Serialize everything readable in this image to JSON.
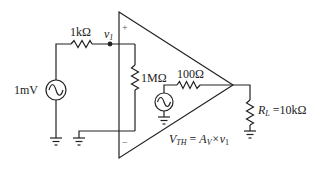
{
  "diagram": {
    "type": "circuit",
    "source": {
      "label": "1mV",
      "type": "ac-voltage-source"
    },
    "input_resistor": {
      "label": "1kΩ"
    },
    "node": {
      "label": "v",
      "subscript": "1"
    },
    "input_impedance": {
      "label": "1MΩ"
    },
    "output_resistor": {
      "label": "100Ω"
    },
    "thevenin": {
      "lhs": "V",
      "lhs_sub": "TH",
      "eq": " = ",
      "rhs": "A",
      "rhs_sub": "V",
      "times": "×v",
      "times_sub": "1"
    },
    "load": {
      "name": "R",
      "name_sub": "L",
      "value": " =10kΩ"
    },
    "amp_signs": {
      "plus": "+",
      "minus": "−"
    },
    "colors": {
      "wire": "#222222",
      "background": "#ffffff"
    }
  }
}
